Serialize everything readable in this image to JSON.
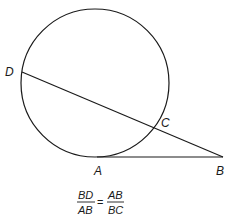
{
  "diagram": {
    "type": "geometry",
    "circle": {
      "cx": 95,
      "cy": 83,
      "r": 74
    },
    "points": {
      "D": {
        "label": "D",
        "x": 22,
        "y": 72
      },
      "C": {
        "label": "C",
        "x": 155,
        "y": 128
      },
      "A": {
        "label": "A",
        "x": 97,
        "y": 157
      },
      "B": {
        "label": "B",
        "x": 223,
        "y": 157
      }
    },
    "segments": [
      {
        "from": "D",
        "to": "B",
        "kind": "secant"
      },
      {
        "from": "A",
        "to": "B",
        "kind": "tangent"
      }
    ],
    "formula": {
      "left_numerator": "BD",
      "left_denominator": "AB",
      "equals": "=",
      "right_numerator": "AB",
      "right_denominator": "BC"
    },
    "stroke_color": "#1a1a1a"
  }
}
